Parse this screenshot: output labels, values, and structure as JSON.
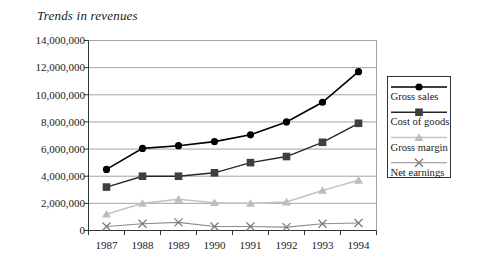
{
  "title": "Trends in revenues",
  "chart_data": {
    "type": "line",
    "title": "Trends in revenues",
    "categories": [
      "1987",
      "1988",
      "1989",
      "1990",
      "1991",
      "1992",
      "1993",
      "1994"
    ],
    "series": [
      {
        "name": "Gross sales",
        "marker": "circle",
        "line_color": "#000000",
        "marker_color": "#000000",
        "line_width": 1.6,
        "values": [
          4500000,
          6050000,
          6250000,
          6550000,
          7050000,
          8000000,
          9450000,
          11700000
        ]
      },
      {
        "name": "Cost of goods",
        "marker": "square",
        "line_color": "#262626",
        "marker_color": "#3f3f3f",
        "line_width": 1.4,
        "values": [
          3200000,
          4000000,
          4000000,
          4250000,
          5000000,
          5450000,
          6500000,
          7900000
        ]
      },
      {
        "name": "Gross margin",
        "marker": "triangle",
        "line_color": "#c4c4c4",
        "marker_color": "#bdbdbd",
        "line_width": 1.6,
        "values": [
          1200000,
          2000000,
          2300000,
          2050000,
          2000000,
          2100000,
          2950000,
          3700000
        ]
      },
      {
        "name": "Net earnings",
        "marker": "x",
        "line_color": "#8c8c8c",
        "marker_color": "#7a7a7a",
        "line_width": 1.1,
        "values": [
          300000,
          500000,
          600000,
          300000,
          300000,
          250000,
          500000,
          550000
        ]
      }
    ],
    "ylim": [
      0,
      14000000
    ],
    "ytick_step": 2000000,
    "ytick_labels": [
      "0",
      "2,000,000",
      "4,000,000",
      "6,000,000",
      "8,000,000",
      "10,000,000",
      "12,000,000",
      "14,000,000"
    ],
    "xlabel": "",
    "ylabel": "",
    "grid": "horizontal",
    "legend_position": "right",
    "legend_entries": [
      "Gross sales",
      "Cost of goods",
      "Gross margin",
      "Net earnings"
    ]
  },
  "colors": {
    "background": "#ffffff",
    "gridline": "#999999",
    "axis": "#333333",
    "plot_border": "#999999",
    "legend_border": "#333333",
    "tick_label": "#1a1a1a"
  }
}
